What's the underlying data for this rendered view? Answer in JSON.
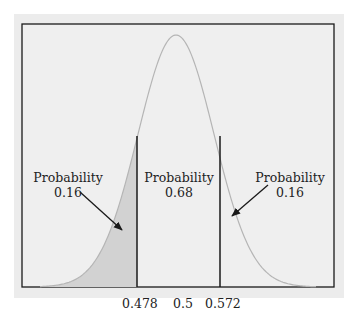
{
  "chart_data": {
    "type": "area",
    "title": "",
    "xlabel": "",
    "ylabel": "",
    "distribution": "normal",
    "mean": 0.5,
    "cutoffs": [
      0.478,
      0.572
    ],
    "tick_labels": [
      "0.478",
      "0.5",
      "0.572"
    ],
    "regions": [
      {
        "label": "Probability",
        "value": "0.16",
        "range": "below 0.478",
        "shaded": true
      },
      {
        "label": "Probability",
        "value": "0.68",
        "range": "0.478 to 0.572",
        "shaded": false
      },
      {
        "label": "Probability",
        "value": "0.16",
        "range": "above 0.572",
        "shaded": false
      }
    ],
    "grid": false,
    "colors": {
      "panel": "#ececec",
      "curve": "#b8b8b8",
      "shade": "#d2d2d2",
      "lines": "#1a1a1a"
    }
  },
  "annotations": {
    "left": {
      "title": "Probability",
      "value": "0.16"
    },
    "center": {
      "title": "Probability",
      "value": "0.68"
    },
    "right": {
      "title": "Probability",
      "value": "0.16"
    }
  },
  "ticks": {
    "left": "0.478",
    "center": "0.5",
    "right": "0.572"
  }
}
